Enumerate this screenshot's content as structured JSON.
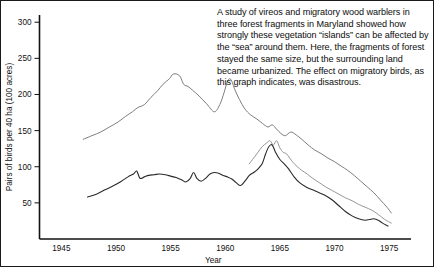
{
  "caption": {
    "text": "A study of vireos and migratory wood warblers in three forest fragments in Maryland showed how strongly these vegetation “islands” can be affected by the “sea” around them. Here, the fragments of forest stayed the same size, but the surrounding land became urbanized. The effect on migratory birds, as this graph indicates, was disastrous."
  },
  "chart_data": {
    "type": "line",
    "title": "",
    "subtitle": "",
    "xlabel": "Year",
    "ylabel": "Pairs of birds per 40 ha (100 acres)",
    "xlim": [
      1943,
      1977
    ],
    "ylim": [
      0,
      310
    ],
    "xticks": [
      1945,
      1950,
      1955,
      1960,
      1965,
      1970,
      1975
    ],
    "xtick_labels": [
      "1945",
      "1950",
      "1955",
      "1960",
      "1965",
      "1970",
      "1975"
    ],
    "yticks": [
      50,
      100,
      150,
      200,
      250,
      300
    ],
    "ytick_labels": [
      "50",
      "100",
      "150",
      "200",
      "250",
      "300"
    ],
    "grid": false,
    "legend": false,
    "legend_position": "none",
    "series": [
      {
        "name": "Fragment 1 (upper curve)",
        "color": "#6e6e6e",
        "width": 0.9,
        "x": [
          1947.0,
          1947.8,
          1948.6,
          1949.4,
          1950.2,
          1950.9,
          1951.5,
          1952.0,
          1952.6,
          1953.2,
          1953.8,
          1954.3,
          1954.9,
          1955.2,
          1955.6,
          1955.9,
          1956.2,
          1956.6,
          1957.0,
          1957.6,
          1958.3,
          1959.0,
          1959.5,
          1959.9,
          1960.2,
          1960.5,
          1960.9,
          1961.3,
          1961.8,
          1962.3,
          1962.9,
          1963.4,
          1963.9,
          1964.3,
          1964.7,
          1965.1,
          1965.5,
          1966.0,
          1966.5,
          1967.0,
          1967.6,
          1968.2,
          1968.8,
          1969.4,
          1970.0,
          1970.6,
          1971.2,
          1971.8,
          1972.4,
          1973.0,
          1973.6,
          1974.2,
          1974.8,
          1975.2
        ],
        "y": [
          138,
          143,
          148,
          155,
          162,
          170,
          176,
          182,
          186,
          196,
          205,
          214,
          222,
          228,
          228,
          224,
          214,
          211,
          206,
          198,
          187,
          176,
          186,
          203,
          218,
          221,
          206,
          193,
          180,
          172,
          166,
          160,
          155,
          158,
          152,
          146,
          143,
          148,
          144,
          138,
          130,
          123,
          118,
          112,
          107,
          101,
          95,
          88,
          80,
          72,
          64,
          54,
          44,
          36
        ]
      },
      {
        "name": "Fragment 2 (middle curve)",
        "color": "#8a8a8a",
        "width": 0.9,
        "x": [
          1962.2,
          1962.6,
          1963.0,
          1963.4,
          1963.8,
          1964.1,
          1964.4,
          1964.7,
          1965.0,
          1965.3,
          1965.6,
          1965.9,
          1966.2,
          1966.6,
          1967.0,
          1967.5,
          1968.0,
          1968.6,
          1969.2,
          1969.8,
          1970.4,
          1971.0,
          1971.6,
          1972.2,
          1972.8,
          1973.4,
          1974.0,
          1974.6,
          1975.2
        ],
        "y": [
          104,
          112,
          120,
          128,
          133,
          136,
          130,
          136,
          126,
          120,
          118,
          112,
          106,
          100,
          95,
          90,
          84,
          78,
          72,
          67,
          62,
          57,
          53,
          48,
          44,
          40,
          34,
          27,
          22
        ]
      },
      {
        "name": "Fragment 3 (lower curve)",
        "color": "#2a2a2a",
        "width": 1.1,
        "x": [
          1947.4,
          1948.2,
          1949.0,
          1949.8,
          1950.5,
          1951.1,
          1951.6,
          1951.9,
          1952.2,
          1952.6,
          1953.0,
          1953.5,
          1954.0,
          1954.5,
          1955.0,
          1955.5,
          1956.0,
          1956.4,
          1956.8,
          1957.1,
          1957.4,
          1957.8,
          1958.2,
          1958.6,
          1959.0,
          1959.4,
          1959.8,
          1960.2,
          1960.6,
          1961.0,
          1961.4,
          1961.8,
          1962.2,
          1962.6,
          1963.0,
          1963.4,
          1963.7,
          1964.0,
          1964.3,
          1964.6,
          1965.0,
          1965.4,
          1965.8,
          1966.3,
          1966.8,
          1967.4,
          1968.0,
          1968.6,
          1969.2,
          1969.8,
          1970.4,
          1971.0,
          1971.6,
          1972.2,
          1972.8,
          1973.2,
          1973.6,
          1974.0,
          1974.4,
          1974.9
        ],
        "y": [
          58,
          62,
          68,
          74,
          80,
          86,
          90,
          94,
          84,
          86,
          88,
          89,
          90,
          89,
          87,
          85,
          82,
          79,
          84,
          92,
          84,
          80,
          84,
          90,
          92,
          91,
          88,
          86,
          83,
          78,
          74,
          80,
          88,
          92,
          97,
          105,
          118,
          128,
          130,
          120,
          110,
          104,
          97,
          86,
          78,
          72,
          68,
          64,
          60,
          54,
          46,
          38,
          32,
          28,
          26,
          27,
          28,
          26,
          22,
          18
        ]
      }
    ]
  }
}
